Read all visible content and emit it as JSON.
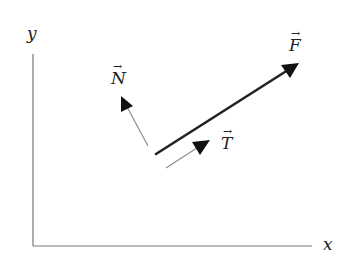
{
  "diagram": {
    "axes": {
      "x_label": "x",
      "y_label": "y",
      "origin": [
        33,
        246
      ],
      "x_end": [
        312,
        246
      ],
      "y_end": [
        33,
        54
      ],
      "color": "#777777"
    },
    "vectors": [
      {
        "name": "F",
        "label": "F",
        "from": [
          156,
          154
        ],
        "to": [
          299,
          63
        ],
        "color": "#222222",
        "width": 2.6
      },
      {
        "name": "N",
        "label": "N",
        "from": [
          148,
          146
        ],
        "to": [
          121,
          96
        ],
        "color": "#888888",
        "width": 1.1
      },
      {
        "name": "T",
        "label": "T",
        "from": [
          166,
          168
        ],
        "to": [
          210,
          140
        ],
        "color": "#888888",
        "width": 1.1
      }
    ],
    "arrow_symbol": "→"
  }
}
